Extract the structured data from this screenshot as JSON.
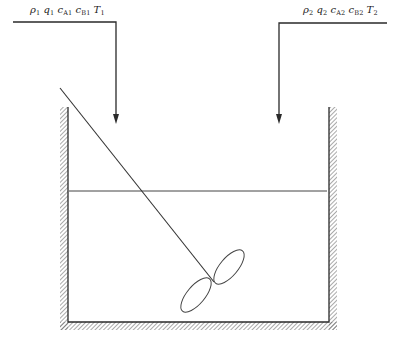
{
  "diagram": {
    "colors": {
      "line": "#2a2a2a",
      "hatch": "#555555",
      "background": "#ffffff"
    },
    "inlet_1": {
      "label_parts": [
        {
          "sym": "ρ",
          "sub": "1"
        },
        {
          "sym": "q",
          "sub": "1"
        },
        {
          "sym": "c",
          "sub": "A1"
        },
        {
          "sym": "c",
          "sub": "B1"
        },
        {
          "sym": "T",
          "sub": "1"
        }
      ],
      "label_text": "ρ1 q1 cA1 cB1 T1"
    },
    "inlet_2": {
      "label_parts": [
        {
          "sym": "ρ",
          "sub": "2"
        },
        {
          "sym": "q",
          "sub": "2"
        },
        {
          "sym": "c",
          "sub": "A2"
        },
        {
          "sym": "c",
          "sub": "B2"
        },
        {
          "sym": "T",
          "sub": "2"
        }
      ],
      "label_text": "ρ2 q2 cA2 cB2 T2"
    },
    "components": [
      "feed-pipe-1",
      "feed-pipe-2",
      "tank",
      "liquid-level",
      "agitator-shaft",
      "impeller"
    ]
  }
}
